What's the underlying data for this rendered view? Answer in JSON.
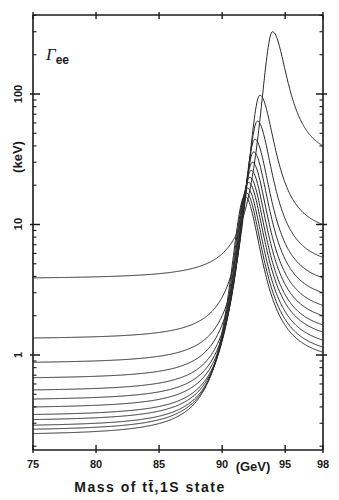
{
  "chart_data": {
    "type": "line",
    "title": "",
    "annotation": {
      "symbol": "Γ",
      "subscript": "ee"
    },
    "xlabel": "Mass of tt̄,1S state",
    "xunit": "(GeV)",
    "ylabel": "(keV)",
    "xlim": [
      75,
      98
    ],
    "ylim": [
      0.19,
      400
    ],
    "yscale": "log",
    "grid": false,
    "legend": null,
    "x_ticks": [
      75,
      80,
      85,
      90,
      95,
      98
    ],
    "x_tick_labels": [
      "75",
      "80",
      "85",
      "90",
      "95",
      "98"
    ],
    "y_ticks": [
      1,
      10,
      100
    ],
    "y_tick_labels": [
      "1",
      "10",
      "100"
    ],
    "series": [
      {
        "name": "curve-1",
        "left_value_at_75": 3.9,
        "peak_x": 94.0,
        "peak_value": 300,
        "right_value_at_98": 40
      },
      {
        "name": "curve-2",
        "left_value_at_75": 1.35,
        "peak_x": 93.0,
        "peak_value": 98,
        "right_value_at_98": 10
      },
      {
        "name": "curve-3",
        "left_value_at_75": 0.88,
        "peak_x": 92.8,
        "peak_value": 62,
        "right_value_at_98": 5.6
      },
      {
        "name": "curve-4",
        "left_value_at_75": 0.67,
        "peak_x": 92.6,
        "peak_value": 45,
        "right_value_at_98": 3.9
      },
      {
        "name": "curve-5",
        "left_value_at_75": 0.54,
        "peak_x": 92.5,
        "peak_value": 36,
        "right_value_at_98": 3.0
      },
      {
        "name": "curve-6",
        "left_value_at_75": 0.46,
        "peak_x": 92.4,
        "peak_value": 30,
        "right_value_at_98": 2.4
      },
      {
        "name": "curve-7",
        "left_value_at_75": 0.4,
        "peak_x": 92.3,
        "peak_value": 26,
        "right_value_at_98": 2.0
      },
      {
        "name": "curve-8",
        "left_value_at_75": 0.35,
        "peak_x": 92.2,
        "peak_value": 23,
        "right_value_at_98": 1.7
      },
      {
        "name": "curve-9",
        "left_value_at_75": 0.32,
        "peak_x": 92.1,
        "peak_value": 21,
        "right_value_at_98": 1.5
      },
      {
        "name": "curve-10",
        "left_value_at_75": 0.29,
        "peak_x": 92.0,
        "peak_value": 19,
        "right_value_at_98": 1.3
      },
      {
        "name": "curve-11",
        "left_value_at_75": 0.27,
        "peak_x": 91.9,
        "peak_value": 17.5,
        "right_value_at_98": 1.15
      },
      {
        "name": "curve-12",
        "left_value_at_75": 0.25,
        "peak_x": 91.8,
        "peak_value": 16.5,
        "right_value_at_98": 1.05
      }
    ]
  },
  "labels": {
    "gamma": "Γ",
    "gamma_sub": "ee",
    "y_unit": "(keV)",
    "x_unit": "(GeV)",
    "x_title": "Mass of tt̄,1S state",
    "x_ticks": [
      "75",
      "80",
      "85",
      "90",
      "95",
      "98"
    ],
    "y_ticks": [
      "100",
      "10",
      "1"
    ]
  }
}
